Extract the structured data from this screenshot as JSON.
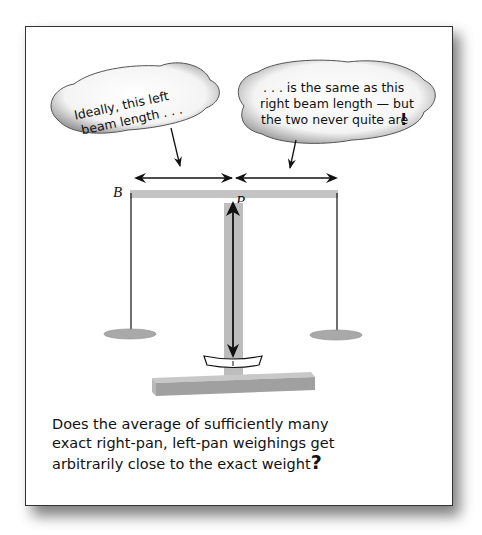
{
  "bubbles": {
    "left": {
      "lines": [
        "Ideally, this left",
        "beam length . . ."
      ]
    },
    "right": {
      "lines": [
        ". . . is the same as this",
        "right beam length — but",
        "the two never quite are"
      ],
      "end_mark": "!"
    }
  },
  "labels": {
    "beam_end": "B",
    "pivot": "P"
  },
  "caption": {
    "lines": [
      "Does the average of sufficiently many",
      "exact right-pan, left-pan weighings get",
      "arbitrarily close to the exact weight"
    ],
    "end_mark": "?"
  },
  "colors": {
    "beam": "#c4c4c4",
    "pillar": "#bdbdbd",
    "pan": "#a9a9a9",
    "base_top": "#c8c8c8",
    "base_front": "#a0a0a0",
    "ink": "#111111"
  }
}
